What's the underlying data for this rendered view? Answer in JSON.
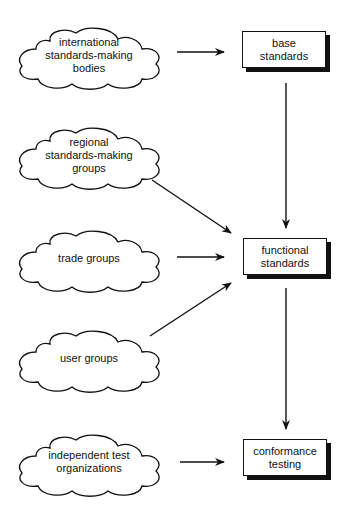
{
  "sources": [
    {
      "id": "international",
      "label": "international\nstandards-making\nbodies",
      "cx": 89,
      "cy": 55
    },
    {
      "id": "regional",
      "label": "regional\nstandards-making\ngroups",
      "cx": 89,
      "cy": 155
    },
    {
      "id": "trade",
      "label": "trade groups",
      "cx": 89,
      "cy": 258
    },
    {
      "id": "user",
      "label": "user groups",
      "cx": 89,
      "cy": 358
    },
    {
      "id": "independent",
      "label": "independent test\norganizations",
      "cx": 89,
      "cy": 462
    }
  ],
  "targets": [
    {
      "id": "base",
      "label": "base\nstandards",
      "x": 242,
      "y": 31,
      "w": 84,
      "h": 37
    },
    {
      "id": "functional",
      "label": "functional\nstandards",
      "x": 243,
      "y": 238,
      "w": 84,
      "h": 37
    },
    {
      "id": "conformance",
      "label": "conformance\ntesting",
      "x": 243,
      "y": 439,
      "w": 84,
      "h": 37
    }
  ],
  "arrows": [
    {
      "from": "international",
      "to": "base",
      "x1": 177,
      "y1": 52,
      "x2": 224,
      "y2": 52
    },
    {
      "from": "regional",
      "to": "functional",
      "x1": 152,
      "y1": 180,
      "x2": 231,
      "y2": 233
    },
    {
      "from": "trade",
      "to": "functional",
      "x1": 177,
      "y1": 257,
      "x2": 224,
      "y2": 257
    },
    {
      "from": "user",
      "to": "functional",
      "x1": 150,
      "y1": 336,
      "x2": 231,
      "y2": 283
    },
    {
      "from": "independent",
      "to": "conformance",
      "x1": 180,
      "y1": 462,
      "x2": 224,
      "y2": 462
    },
    {
      "from": "base",
      "to": "functional",
      "x1": 286,
      "y1": 83,
      "x2": 286,
      "y2": 228
    },
    {
      "from": "functional",
      "to": "conformance",
      "x1": 286,
      "y1": 288,
      "x2": 286,
      "y2": 429
    }
  ]
}
